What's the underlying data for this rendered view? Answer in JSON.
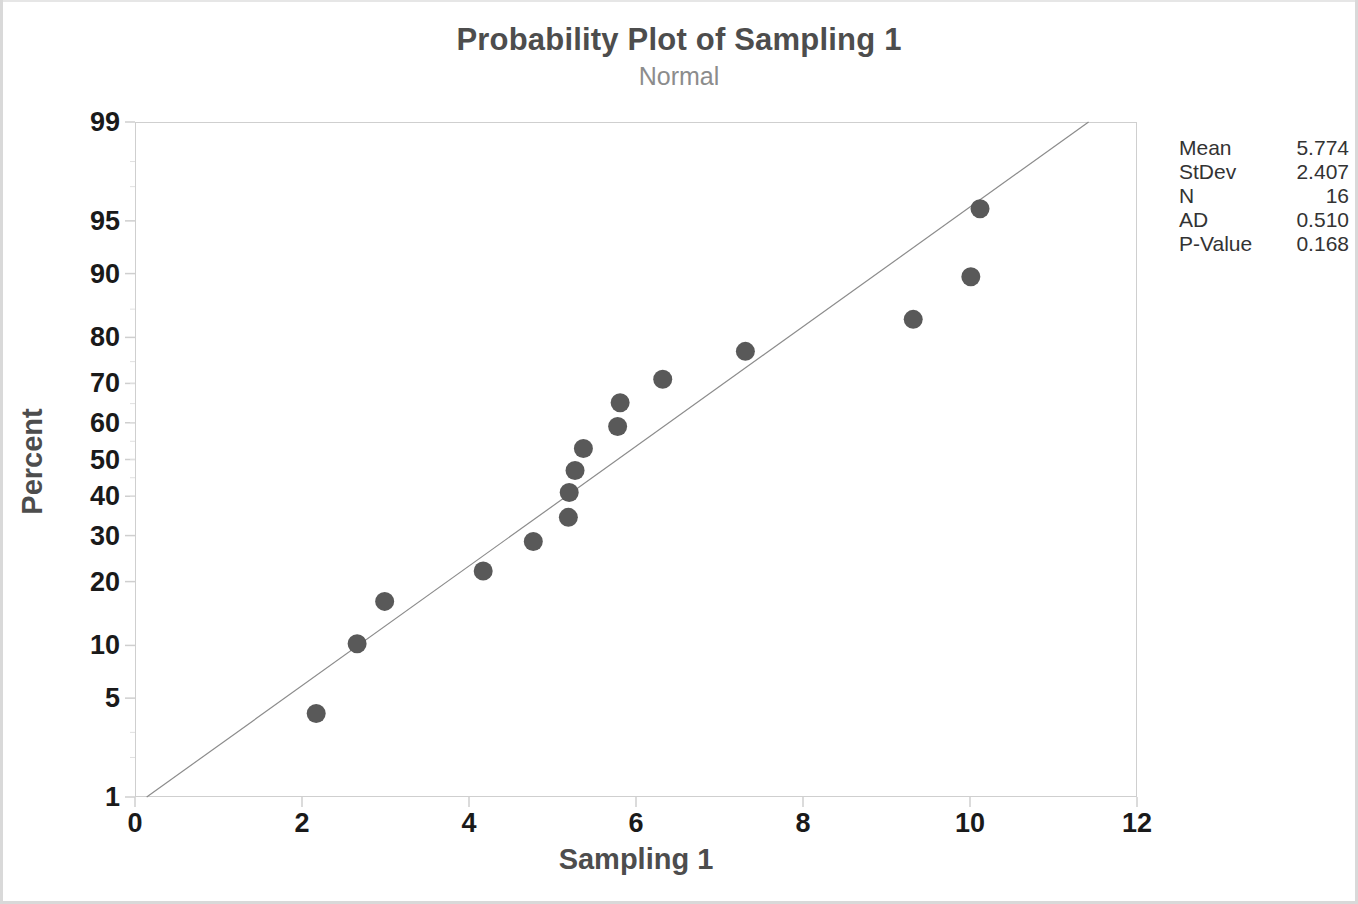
{
  "title": "Probability Plot of Sampling 1",
  "subtitle": "Normal",
  "axis": {
    "xlabel": "Sampling 1",
    "ylabel": "Percent"
  },
  "stats": {
    "rows": [
      {
        "key": "Mean",
        "value": "5.774"
      },
      {
        "key": "StDev",
        "value": "2.407"
      },
      {
        "key": "N",
        "value": "16"
      },
      {
        "key": "AD",
        "value": "0.510"
      },
      {
        "key": "P-Value",
        "value": "0.168"
      }
    ]
  },
  "colors": {
    "marker": "#595959",
    "fit_line": "#8c8c8c",
    "frame": "#cfcfcf",
    "title": "#4d4d4d",
    "subtitle": "#8c8c8c",
    "tick_text": "#1a1a1a"
  },
  "chart_data": {
    "type": "scatter",
    "title": "Probability Plot of Sampling 1",
    "subtitle": "Normal",
    "xlabel": "Sampling 1",
    "ylabel": "Percent",
    "xlim": [
      0,
      12
    ],
    "xticks": [
      0,
      2,
      4,
      6,
      8,
      10,
      12
    ],
    "yticks": [
      1,
      5,
      10,
      20,
      30,
      40,
      50,
      60,
      70,
      80,
      90,
      95,
      99
    ],
    "yscale": "normal-probability",
    "ylim": [
      1,
      99
    ],
    "grid": false,
    "legend": false,
    "series": [
      {
        "name": "Sampling 1",
        "marker": "filled-circle",
        "x": [
          2.17,
          2.66,
          2.99,
          4.17,
          4.77,
          5.19,
          5.2,
          5.27,
          5.37,
          5.78,
          5.81,
          6.32,
          7.31,
          9.32,
          10.01,
          10.12
        ],
        "percent": [
          4.0,
          10.2,
          16.4,
          22.1,
          28.6,
          34.5,
          41.0,
          47.0,
          53.0,
          59.0,
          65.2,
          71.0,
          77.2,
          83.3,
          89.6,
          95.8
        ]
      }
    ],
    "fit_line": {
      "name": "Normal distribution fit",
      "mean": 5.774,
      "stdev": 2.407,
      "x_endpoints": [
        0.14,
        11.42
      ],
      "percent_endpoints": [
        1,
        99
      ]
    },
    "annotations": {
      "Mean": 5.774,
      "StDev": 2.407,
      "N": 16,
      "AD": 0.51,
      "P-Value": 0.168
    }
  }
}
